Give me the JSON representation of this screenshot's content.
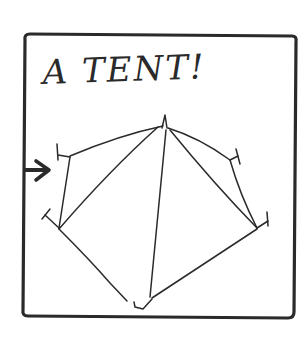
{
  "drawing": {
    "title": "A TENT!",
    "subject": "tent-sketch",
    "pointer": "arrow-right-icon",
    "colors": {
      "ink": "#2a2a2a",
      "paper": "#ffffff"
    }
  }
}
